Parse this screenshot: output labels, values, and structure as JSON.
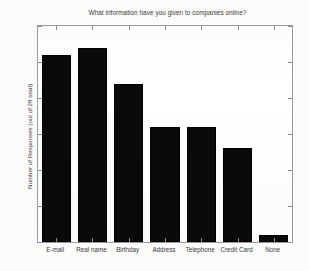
{
  "chart_data": {
    "type": "bar",
    "title": "What information have you given to companies online?",
    "xlabel": "",
    "ylabel": "Number of Responses (out of 28 total)",
    "categories": [
      "E-mail",
      "Real name",
      "Birthday",
      "Address",
      "Telephone",
      "Credit Card",
      "None"
    ],
    "values": [
      26,
      27,
      22,
      16,
      16,
      13,
      1
    ],
    "ylim": [
      0,
      30
    ],
    "yticks": [
      0,
      5,
      10,
      15,
      20,
      25,
      30
    ],
    "ytick_labels": [
      "0",
      "5",
      "10",
      "15",
      "20",
      "25",
      "30"
    ],
    "grid": false,
    "legend": false,
    "bar_color": "#0a0a0a",
    "axis_color": "#8d8d8d",
    "background": "#ffffff"
  }
}
